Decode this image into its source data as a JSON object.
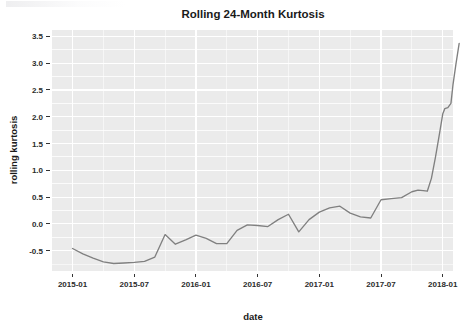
{
  "chart_data": {
    "type": "line",
    "title": "Rolling 24-Month Kurtosis",
    "xlabel": "date",
    "ylabel": "rolling kurtosis",
    "grid": true,
    "legend": false,
    "legend_position": "none",
    "line_color": "#808080",
    "panel_color": "#ebebeb",
    "grid_color": "#ffffff",
    "ylim": [
      -0.88,
      3.62
    ],
    "yticks": [
      -0.5,
      0.0,
      0.5,
      1.0,
      1.5,
      2.0,
      2.5,
      3.0,
      3.5
    ],
    "ytick_labels": [
      "-0.5",
      "0.0",
      "0.5",
      "1.0",
      "1.5",
      "2.0",
      "2.5",
      "3.0",
      "3.5"
    ],
    "xlim": [
      "2014-11",
      "2018-02"
    ],
    "xticks": [
      "2015-01",
      "2015-07",
      "2016-01",
      "2016-07",
      "2017-01",
      "2017-07",
      "2018-01"
    ],
    "xtick_labels": [
      "2015-01",
      "2015-07",
      "2016-01",
      "2016-07",
      "2017-01",
      "2017-07",
      "2018-01"
    ],
    "x": [
      "2015-01",
      "2015-02",
      "2015-03",
      "2015-04",
      "2015-05",
      "2015-06",
      "2015-07",
      "2015-08",
      "2015-09",
      "2015-10",
      "2015-11",
      "2015-12",
      "2016-01",
      "2016-02",
      "2016-03",
      "2016-04",
      "2016-05",
      "2016-06",
      "2016-07",
      "2016-08",
      "2016-09",
      "2016-10",
      "2016-11",
      "2016-12",
      "2017-01",
      "2017-02",
      "2017-03",
      "2017-04",
      "2017-05",
      "2017-06",
      "2017-07",
      "2017-08",
      "2017-09",
      "2017-10",
      "2017-11",
      "2017-12",
      "2018-01"
    ],
    "values": [
      -0.46,
      -0.56,
      -0.64,
      -0.71,
      -0.74,
      -0.73,
      -0.72,
      -0.7,
      -0.62,
      -0.2,
      -0.38,
      -0.3,
      -0.21,
      -0.27,
      -0.37,
      -0.37,
      -0.12,
      -0.02,
      -0.03,
      -0.05,
      0.08,
      0.18,
      -0.15,
      0.08,
      0.22,
      0.3,
      0.33,
      0.2,
      0.13,
      0.11,
      0.45,
      0.47,
      0.49,
      0.6,
      0.62,
      0.6,
      3.37
    ],
    "series_name": "rolling kurtosis",
    "annotations": []
  },
  "chart_extra": {
    "tail_points": [
      {
        "x": "2017-10",
        "y": 0.6
      },
      {
        "x": "2017-11",
        "y": 0.63
      },
      {
        "x": "2017-12",
        "y": 0.61
      },
      {
        "x": "2018-01",
        "y": 3.37
      }
    ],
    "tail_detail": [
      {
        "t": 33.0,
        "y": 0.6
      },
      {
        "t": 33.6,
        "y": 0.63
      },
      {
        "t": 34.1,
        "y": 0.62
      },
      {
        "t": 34.5,
        "y": 0.61
      },
      {
        "t": 34.9,
        "y": 0.85
      },
      {
        "t": 35.3,
        "y": 1.25
      },
      {
        "t": 35.7,
        "y": 1.7
      },
      {
        "t": 36.0,
        "y": 2.05
      },
      {
        "t": 36.2,
        "y": 2.15
      },
      {
        "t": 36.5,
        "y": 2.17
      },
      {
        "t": 36.8,
        "y": 2.25
      },
      {
        "t": 37.0,
        "y": 2.6
      },
      {
        "t": 37.3,
        "y": 3.0
      },
      {
        "t": 37.6,
        "y": 3.37
      }
    ],
    "minor_ticks_between_major": 1,
    "y_minor_offset": 0.25
  }
}
